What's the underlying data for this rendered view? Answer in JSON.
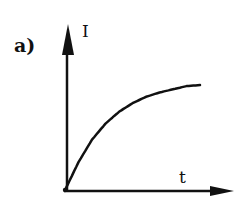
{
  "figure": {
    "panel_label": "a)",
    "y_axis_label": "I",
    "x_axis_label": "t",
    "ink_color": "#111111"
  },
  "chart_data": {
    "type": "line",
    "title": "",
    "panel": "a)",
    "xlabel": "t",
    "ylabel": "I",
    "ticks": "none",
    "grid": false,
    "series": [
      {
        "name": "I(t)",
        "function": "1 - exp(-t/tau)",
        "x": [
          0,
          0.1,
          0.2,
          0.3,
          0.4,
          0.5,
          0.6,
          0.7,
          0.8,
          0.9,
          1.0
        ],
        "y": [
          0,
          0.26,
          0.47,
          0.62,
          0.73,
          0.81,
          0.87,
          0.91,
          0.94,
          0.97,
          0.98
        ]
      }
    ],
    "xlim": [
      0,
      1.2
    ],
    "ylim": [
      0,
      1.5
    ]
  }
}
